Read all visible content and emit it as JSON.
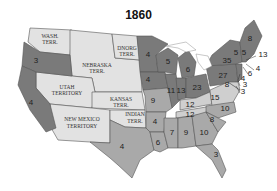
{
  "title": "1860",
  "colors": {
    "free_state": "#7a7a7a",
    "slave_state": "#a9a9a9",
    "border_state": "#cfcfcf",
    "territory": "#e2e2e2",
    "border": "#555555",
    "lakes": "#ffffff"
  },
  "territories": [
    {
      "name": "WASH.",
      "name2": "TERR."
    },
    {
      "name": "DNORG",
      "name2": "TERR."
    },
    {
      "name": "NEBRASKA",
      "name2": "TERR."
    },
    {
      "name": "UTAH",
      "name2": "TERRITORY"
    },
    {
      "name": "KANSAS",
      "name2": "TERR."
    },
    {
      "name": "NEW MEXICO",
      "name2": "TERRITORY"
    },
    {
      "name": "INDIAN",
      "name2": "TERR."
    }
  ],
  "electoral_votes": {
    "oregon": "3",
    "california": "4",
    "minnesota": "4",
    "iowa": "4",
    "wisconsin": "5",
    "michigan": "6",
    "illinois": "11",
    "indiana": "13",
    "ohio": "23",
    "pennsylvania": "27",
    "new_york": "35",
    "maine": "8",
    "vermont": "5",
    "new_hampshire": "5",
    "massachusetts": "13",
    "rhode_island": "4",
    "connecticut": "6",
    "new_jersey": "4",
    "delaware": "3",
    "maryland": "8",
    "dc_label": "3",
    "missouri": "9",
    "kentucky": "12",
    "virginia": "15",
    "tennessee": "12",
    "north_carolina": "10",
    "south_carolina": "8",
    "arkansas": "4",
    "texas": "4",
    "louisiana": "6",
    "mississippi": "7",
    "alabama": "9",
    "georgia": "10",
    "florida": "3"
  }
}
